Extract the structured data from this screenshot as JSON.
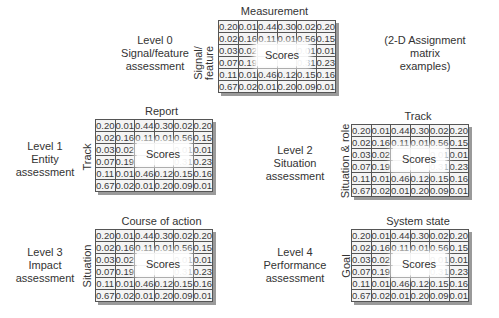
{
  "note": {
    "lines": [
      "(2-D Assignment",
      "matrix",
      "examples)"
    ]
  },
  "overlay_label": "Scores",
  "matrix_values": [
    [
      "0.20",
      "0.01",
      "0.44",
      "0.30",
      "0.02",
      "0.20"
    ],
    [
      "0.02",
      "0.16",
      "0.11",
      "0.01",
      "0.56",
      "0.15"
    ],
    [
      "0.03",
      "0.02",
      "",
      "",
      "0.01",
      "0.01"
    ],
    [
      "0.07",
      "0.19",
      "",
      "",
      "0.31",
      "0.23"
    ],
    [
      "0.11",
      "0.01",
      "0.46",
      "0.12",
      "0.15",
      "0.16"
    ],
    [
      "0.67",
      "0.02",
      "0.01",
      "0.20",
      "0.09",
      "0.01"
    ]
  ],
  "levels": [
    {
      "label": [
        "Level 0",
        "Signal/feature",
        "assessment"
      ],
      "col_title": "Measurement",
      "row_title": "Signal/ feature"
    },
    {
      "label": [
        "Level 1",
        "Entity",
        "assessment"
      ],
      "col_title": "Report",
      "row_title": "Track"
    },
    {
      "label": [
        "Level 2",
        "Situation",
        "assessment"
      ],
      "col_title": "Track",
      "row_title": "Situation & role"
    },
    {
      "label": [
        "Level 3",
        "Impact",
        "assessment"
      ],
      "col_title": "Course of action",
      "row_title": "Situation"
    },
    {
      "label": [
        "Level 4",
        "Performance",
        "assessment"
      ],
      "col_title": "System state",
      "row_title": "Goal"
    }
  ]
}
